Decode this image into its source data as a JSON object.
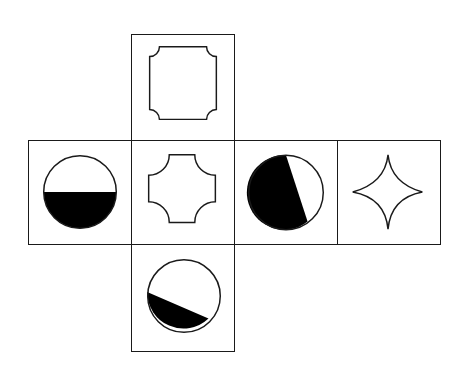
{
  "diagram": {
    "type": "cube-net",
    "stroke_color": "#1a1a1a",
    "fill_color": "#000000",
    "faces": [
      {
        "position": "top",
        "shape": "square-concave-corners",
        "label": "Square with concave corners"
      },
      {
        "position": "left",
        "shape": "circle-half-filled-bottom",
        "label": "Circle, bottom half filled"
      },
      {
        "position": "center",
        "shape": "cross-concave-corners",
        "label": "Cross shape with concave arcs"
      },
      {
        "position": "right-1",
        "shape": "circle-diagonal-filled-left",
        "label": "Circle, left portion filled along a diagonal"
      },
      {
        "position": "right-2",
        "shape": "four-point-star",
        "label": "Four-pointed concave star"
      },
      {
        "position": "bottom",
        "shape": "circle-diagonal-filled-bottom",
        "label": "Circle, bottom segment filled along a slant"
      }
    ]
  }
}
